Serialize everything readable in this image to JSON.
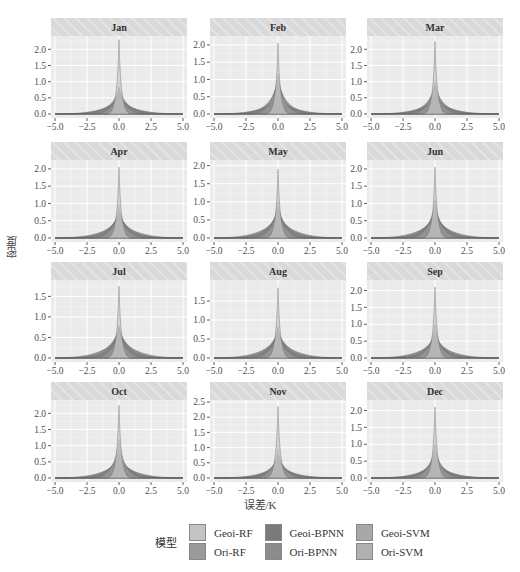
{
  "chart_data": {
    "type": "area",
    "title": "",
    "xlabel": "误差/K",
    "ylabel": "密度",
    "xlim": [
      -5.0,
      5.0
    ],
    "x_ticks": [
      "-5.0",
      "-2.5",
      "0.0",
      "2.5",
      "5.0"
    ],
    "grid": true,
    "facet_layout": {
      "rows": 4,
      "cols": 3
    },
    "legend": {
      "title": "模型",
      "position": "bottom",
      "entries": [
        "Geoi-RF",
        "Ori-RF",
        "Geoi-BPNN",
        "Ori-BPNN",
        "Geoi-SVM",
        "Ori-SVM"
      ],
      "colors": [
        "#c4c4c4",
        "#9a9a9a",
        "#7a7a7a",
        "#8c8c8c",
        "#a8a8a8",
        "#b0b0b0"
      ]
    },
    "panels": [
      {
        "label": "Jan",
        "y_ticks": [
          "0.0",
          "0.5",
          "1.0",
          "1.5",
          "2.0"
        ],
        "ylim": [
          0,
          2.35
        ],
        "peaks": {
          "Geoi-RF": 2.3,
          "Ori-RF": 0.85,
          "Geoi-BPNN": 0.8,
          "Ori-BPNN": 0.6,
          "Geoi-SVM": 0.55,
          "Ori-SVM": 0.5
        }
      },
      {
        "label": "Feb",
        "y_ticks": [
          "0.0",
          "0.5",
          "1.0",
          "1.5",
          "2.0"
        ],
        "ylim": [
          0,
          2.2
        ],
        "peaks": {
          "Geoi-RF": 2.05,
          "Ori-RF": 1.15,
          "Geoi-BPNN": 1.0,
          "Ori-BPNN": 0.6,
          "Geoi-SVM": 0.55,
          "Ori-SVM": 0.5
        }
      },
      {
        "label": "Mar",
        "y_ticks": [
          "0.0",
          "0.5",
          "1.0",
          "1.5",
          "2.0"
        ],
        "ylim": [
          0,
          2.35
        ],
        "peaks": {
          "Geoi-RF": 2.25,
          "Ori-RF": 1.0,
          "Geoi-BPNN": 0.9,
          "Ori-BPNN": 0.6,
          "Geoi-SVM": 0.55,
          "Ori-SVM": 0.5
        }
      },
      {
        "label": "Apr",
        "y_ticks": [
          "0.0",
          "0.5",
          "1.0",
          "1.5",
          "2.0"
        ],
        "ylim": [
          0,
          2.2
        ],
        "peaks": {
          "Geoi-RF": 2.05,
          "Ori-RF": 0.95,
          "Geoi-BPNN": 0.8,
          "Ori-BPNN": 0.7,
          "Geoi-SVM": 0.65,
          "Ori-SVM": 0.6
        }
      },
      {
        "label": "May",
        "y_ticks": [
          "0.0",
          "0.5",
          "1.0",
          "1.5",
          "2.0"
        ],
        "ylim": [
          0,
          2.1
        ],
        "peaks": {
          "Geoi-RF": 1.9,
          "Ori-RF": 1.0,
          "Geoi-BPNN": 0.85,
          "Ori-BPNN": 0.75,
          "Geoi-SVM": 0.7,
          "Ori-SVM": 0.65
        }
      },
      {
        "label": "Jun",
        "y_ticks": [
          "0.0",
          "0.5",
          "1.0",
          "1.5",
          "2.0"
        ],
        "ylim": [
          0,
          2.2
        ],
        "peaks": {
          "Geoi-RF": 2.05,
          "Ori-RF": 1.1,
          "Geoi-BPNN": 0.9,
          "Ori-BPNN": 0.75,
          "Geoi-SVM": 0.7,
          "Ori-SVM": 0.65
        }
      },
      {
        "label": "Jul",
        "y_ticks": [
          "0.0",
          "0.5",
          "1.0",
          "1.5"
        ],
        "ylim": [
          0,
          1.85
        ],
        "peaks": {
          "Geoi-RF": 1.75,
          "Ori-RF": 0.8,
          "Geoi-BPNN": 0.75,
          "Ori-BPNN": 0.7,
          "Geoi-SVM": 0.65,
          "Ori-SVM": 0.6
        }
      },
      {
        "label": "Aug",
        "y_ticks": [
          "0.0",
          "0.5",
          "1.0",
          "1.5"
        ],
        "ylim": [
          0,
          2.0
        ],
        "peaks": {
          "Geoi-RF": 1.85,
          "Ori-RF": 0.85,
          "Geoi-BPNN": 0.75,
          "Ori-BPNN": 0.7,
          "Geoi-SVM": 0.65,
          "Ori-SVM": 0.6
        }
      },
      {
        "label": "Sep",
        "y_ticks": [
          "0.0",
          "0.5",
          "1.0",
          "1.5",
          "2.0"
        ],
        "ylim": [
          0,
          2.25
        ],
        "peaks": {
          "Geoi-RF": 2.1,
          "Ori-RF": 1.0,
          "Geoi-BPNN": 0.75,
          "Ori-BPNN": 0.7,
          "Geoi-SVM": 0.65,
          "Ori-SVM": 0.6
        }
      },
      {
        "label": "Oct",
        "y_ticks": [
          "0.0",
          "0.5",
          "1.0",
          "1.5",
          "2.0"
        ],
        "ylim": [
          0,
          2.35
        ],
        "peaks": {
          "Geoi-RF": 2.25,
          "Ori-RF": 1.2,
          "Geoi-BPNN": 0.85,
          "Ori-BPNN": 0.7,
          "Geoi-SVM": 0.65,
          "Ori-SVM": 0.6
        }
      },
      {
        "label": "Nov",
        "y_ticks": [
          "0.0",
          "0.5",
          "1.0",
          "1.5",
          "2.0",
          "2.5"
        ],
        "ylim": [
          0,
          2.5
        ],
        "peaks": {
          "Geoi-RF": 2.35,
          "Ori-RF": 0.95,
          "Geoi-BPNN": 0.75,
          "Ori-BPNN": 0.6,
          "Geoi-SVM": 0.5,
          "Ori-SVM": 0.45
        }
      },
      {
        "label": "Dec",
        "y_ticks": [
          "0.0",
          "0.5",
          "1.0",
          "1.5",
          "2.0"
        ],
        "ylim": [
          0,
          2.25
        ],
        "peaks": {
          "Geoi-RF": 2.1,
          "Ori-RF": 1.0,
          "Geoi-BPNN": 0.8,
          "Ori-BPNN": 0.6,
          "Geoi-SVM": 0.55,
          "Ori-SVM": 0.45
        }
      }
    ]
  },
  "axes": {
    "xlabel": "误差/K",
    "ylabel": "密度"
  },
  "legend": {
    "title": "模型",
    "items": [
      {
        "label": "Geoi-RF",
        "color": "#c4c4c4"
      },
      {
        "label": "Ori-RF",
        "color": "#9a9a9a"
      },
      {
        "label": "Geoi-BPNN",
        "color": "#7a7a7a"
      },
      {
        "label": "Ori-BPNN",
        "color": "#8c8c8c"
      },
      {
        "label": "Geoi-SVM",
        "color": "#a8a8a8"
      },
      {
        "label": "Ori-SVM",
        "color": "#b0b0b0"
      }
    ]
  },
  "style": {
    "panel_bg": "#ebebeb",
    "grid_major": "#ffffff",
    "grid_minor": "#f5f5f5",
    "strip_bg": "#d9d9d9",
    "strip_hatch": "#e8e8e8",
    "tick_text": "#4d4d4d"
  }
}
